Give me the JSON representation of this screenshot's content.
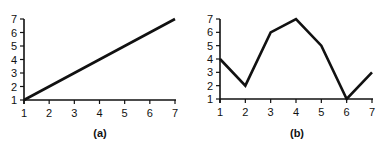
{
  "chart_data": [
    {
      "type": "line",
      "title": "",
      "caption": "(a)",
      "xlabel": "",
      "ylabel": "",
      "x": [
        1,
        2,
        3,
        4,
        5,
        6,
        7
      ],
      "series": [
        {
          "name": "a",
          "values": [
            1,
            2,
            3,
            4,
            5,
            6,
            7
          ]
        }
      ],
      "xlim": [
        1,
        7
      ],
      "ylim": [
        1,
        7
      ],
      "xticks": [
        "1",
        "2",
        "3",
        "4",
        "5",
        "6",
        "7"
      ],
      "yticks": [
        "1",
        "2",
        "3",
        "4",
        "5",
        "6",
        "7"
      ],
      "grid": false,
      "legend": "none"
    },
    {
      "type": "line",
      "title": "",
      "caption": "(b)",
      "xlabel": "",
      "ylabel": "",
      "x": [
        1,
        2,
        3,
        4,
        5,
        6,
        7
      ],
      "series": [
        {
          "name": "b",
          "values": [
            4,
            2,
            6,
            7,
            5,
            1,
            3
          ]
        }
      ],
      "xlim": [
        1,
        7
      ],
      "ylim": [
        1,
        7
      ],
      "xticks": [
        "1",
        "2",
        "3",
        "4",
        "5",
        "6",
        "7"
      ],
      "yticks": [
        "1",
        "2",
        "3",
        "4",
        "5",
        "6",
        "7"
      ],
      "grid": false,
      "legend": "none"
    }
  ]
}
